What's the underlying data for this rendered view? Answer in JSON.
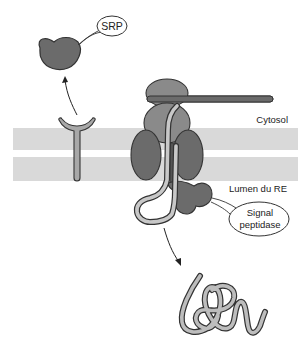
{
  "diagram": {
    "labels": {
      "srp": "SRP",
      "cytosol": "Cytosol",
      "lumen": "Lumen du RE",
      "signal_peptidase_line1": "Signal",
      "signal_peptidase_line2": "peptidase"
    },
    "colors": {
      "membrane": "#d9d9d9",
      "protein_dark": "#6b6b6b",
      "protein_medium": "#8a8a8a",
      "receptor": "#a8a8a8",
      "polypeptide_fill": "#bdbdbd",
      "outline": "#333333"
    }
  }
}
